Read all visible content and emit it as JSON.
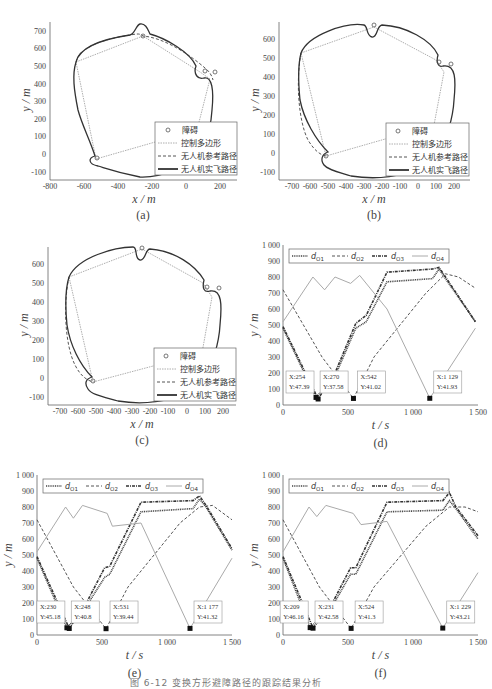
{
  "figure": {
    "caption": "图 6-12  变换方形避障路径的跟踪结果分析"
  },
  "legend_path": {
    "obstacle": "障碍",
    "polygon": "控制多边形",
    "reference": "无人机参考路径",
    "actual": "无人机实飞路径"
  },
  "legend_dist": {
    "d1": "d",
    "d1_sub": "O1",
    "d2": "d",
    "d2_sub": "O2",
    "d3": "d",
    "d3_sub": "O3",
    "d4": "d",
    "d4_sub": "O4"
  },
  "panels": {
    "a": {
      "label": "(a)",
      "xlabel": "x / m",
      "ylabel": "y / m"
    },
    "b": {
      "label": "(b)",
      "xlabel": "x / m",
      "ylabel": "y / m"
    },
    "c": {
      "label": "(c)",
      "xlabel": "x / m",
      "ylabel": "y / m"
    },
    "d": {
      "label": "(d)",
      "xlabel": "t / s",
      "ylabel": "y / m",
      "ann": [
        {
          "x": "X:254",
          "y": "Y:47.39"
        },
        {
          "x": "X:270",
          "y": "Y:37.58"
        },
        {
          "x": "X:542",
          "y": "Y:41.02"
        },
        {
          "x": "X:1 129",
          "y": "Y:41.93"
        }
      ]
    },
    "e": {
      "label": "(e)",
      "xlabel": "t / s",
      "ylabel": "y / m",
      "ann": [
        {
          "x": "X:230",
          "y": "Y:45.18"
        },
        {
          "x": "X:248",
          "y": "Y:40.8"
        },
        {
          "x": "X:531",
          "y": "Y:39.44"
        },
        {
          "x": "X:1 177",
          "y": "Y:41.32"
        }
      ]
    },
    "f": {
      "label": "(f)",
      "xlabel": "t / s",
      "ylabel": "y / m",
      "ann": [
        {
          "x": "X:209",
          "y": "Y:46.16"
        },
        {
          "x": "X:231",
          "y": "Y:42.58"
        },
        {
          "x": "X:524",
          "y": "Y:41.3"
        },
        {
          "x": "X:1 229",
          "y": "Y:43.21"
        }
      ]
    }
  },
  "chart_data": [
    {
      "id": "a",
      "type": "line",
      "title": "(a)",
      "xlabel": "x/m",
      "ylabel": "y/m",
      "xlim": [
        -800,
        300
      ],
      "ylim": [
        -150,
        750
      ],
      "xticks": [
        -800,
        -600,
        -400,
        -200,
        0,
        200
      ],
      "yticks": [
        -100,
        0,
        100,
        200,
        300,
        400,
        500,
        600,
        700
      ],
      "legend": [
        "障碍",
        "控制多边形",
        "无人机参考路径",
        "无人机实飞路径"
      ],
      "legend_position": "lower right",
      "obstacles": [
        [
          -255,
          670
        ],
        [
          105,
          470
        ],
        [
          170,
          465
        ],
        [
          -520,
          -20
        ]
      ],
      "control_polygon": [
        [
          -650,
          520
        ],
        [
          -255,
          670
        ],
        [
          90,
          470
        ],
        [
          140,
          430
        ],
        [
          60,
          150
        ],
        [
          -520,
          -20
        ],
        [
          -650,
          520
        ]
      ]
    },
    {
      "id": "b",
      "type": "line",
      "title": "(b)",
      "xlabel": "x/m",
      "ylabel": "y/m",
      "xlim": [
        -780,
        270
      ],
      "ylim": [
        -150,
        680
      ],
      "xticks": [
        -700,
        -600,
        -500,
        -400,
        -300,
        -200,
        -100,
        0,
        100,
        200
      ],
      "yticks": [
        -100,
        0,
        100,
        200,
        300,
        400,
        500,
        600
      ],
      "legend": [
        "障碍",
        "控制多边形",
        "无人机参考路径",
        "无人机实飞路径"
      ],
      "legend_position": "lower right",
      "obstacles": [
        [
          -255,
          670
        ],
        [
          105,
          470
        ],
        [
          170,
          465
        ],
        [
          -520,
          -20
        ]
      ]
    },
    {
      "id": "c",
      "type": "line",
      "title": "(c)",
      "xlabel": "x/m",
      "ylabel": "y/m",
      "xlim": [
        -780,
        270
      ],
      "ylim": [
        -150,
        680
      ],
      "xticks": [
        -700,
        -600,
        -500,
        -400,
        -300,
        -200,
        -100,
        0,
        100,
        200
      ],
      "yticks": [
        -100,
        0,
        100,
        200,
        300,
        400,
        500,
        600
      ],
      "legend": [
        "障碍",
        "控制多边形",
        "无人机参考路径",
        "无人机实飞路径"
      ],
      "legend_position": "lower right",
      "obstacles": [
        [
          -255,
          670
        ],
        [
          105,
          470
        ],
        [
          170,
          465
        ],
        [
          -520,
          -20
        ]
      ]
    },
    {
      "id": "d",
      "type": "line",
      "title": "(d)",
      "xlabel": "t/s",
      "ylabel": "y/m",
      "xlim": [
        0,
        1500
      ],
      "ylim": [
        0,
        1000
      ],
      "xticks": [
        0,
        500,
        1000,
        1500
      ],
      "yticks": [
        0,
        100,
        200,
        300,
        400,
        500,
        600,
        700,
        800,
        900,
        1000
      ],
      "legend": [
        "d_O1",
        "d_O2",
        "d_O3",
        "d_O4"
      ],
      "legend_position": "top",
      "series": [
        {
          "name": "d_O1",
          "x": [
            0,
            254,
            400,
            560,
            640,
            800,
            1150,
            1200,
            1250,
            1480
          ],
          "y": [
            480,
            47,
            180,
            480,
            520,
            770,
            790,
            850,
            790,
            520
          ]
        },
        {
          "name": "d_O2",
          "x": [
            0,
            300,
            542,
            700,
            1100,
            1250,
            1350,
            1480
          ],
          "y": [
            720,
            300,
            41,
            300,
            700,
            820,
            800,
            730
          ]
        },
        {
          "name": "d_O3",
          "x": [
            0,
            270,
            400,
            560,
            640,
            800,
            1150,
            1200,
            1250,
            1480
          ],
          "y": [
            490,
            38,
            200,
            510,
            560,
            830,
            850,
            860,
            800,
            520
          ]
        },
        {
          "name": "d_O4",
          "x": [
            0,
            230,
            320,
            400,
            520,
            590,
            800,
            1129,
            1480
          ],
          "y": [
            520,
            800,
            720,
            800,
            760,
            810,
            600,
            42,
            480
          ]
        }
      ],
      "annotations": [
        {
          "x": 254,
          "y": 47.39
        },
        {
          "x": 270,
          "y": 37.58
        },
        {
          "x": 542,
          "y": 41.02
        },
        {
          "x": 1129,
          "y": 41.93
        }
      ]
    },
    {
      "id": "e",
      "type": "line",
      "title": "(e)",
      "xlabel": "t/s",
      "ylabel": "y/m",
      "xlim": [
        0,
        1500
      ],
      "ylim": [
        0,
        1000
      ],
      "xticks": [
        0,
        500,
        1000,
        1500
      ],
      "yticks": [
        0,
        100,
        200,
        300,
        400,
        500,
        600,
        700,
        800,
        900,
        1000
      ],
      "legend": [
        "d_O1",
        "d_O2",
        "d_O3",
        "d_O4"
      ],
      "legend_position": "top",
      "series": [
        {
          "name": "d_O1",
          "x": [
            0,
            230,
            380,
            520,
            560,
            800,
            1200,
            1250,
            1300,
            1500
          ],
          "y": [
            480,
            45,
            180,
            360,
            380,
            770,
            790,
            850,
            800,
            530
          ]
        },
        {
          "name": "d_O2",
          "x": [
            0,
            280,
            531,
            700,
            1100,
            1250,
            1350,
            1500
          ],
          "y": [
            720,
            300,
            39,
            300,
            700,
            800,
            810,
            720
          ]
        },
        {
          "name": "d_O3",
          "x": [
            0,
            248,
            380,
            520,
            560,
            800,
            1200,
            1250,
            1300,
            1500
          ],
          "y": [
            490,
            41,
            200,
            420,
            430,
            830,
            840,
            870,
            810,
            540
          ]
        },
        {
          "name": "d_O4",
          "x": [
            0,
            220,
            280,
            350,
            540,
            580,
            800,
            1177,
            1500
          ],
          "y": [
            520,
            800,
            730,
            810,
            760,
            680,
            700,
            41,
            480
          ]
        }
      ],
      "annotations": [
        {
          "x": 230,
          "y": 45.18
        },
        {
          "x": 248,
          "y": 40.8
        },
        {
          "x": 531,
          "y": 39.44
        },
        {
          "x": 1177,
          "y": 41.32
        }
      ]
    },
    {
      "id": "f",
      "type": "line",
      "title": "(f)",
      "xlabel": "t/s",
      "ylabel": "y/m",
      "xlim": [
        0,
        1500
      ],
      "ylim": [
        0,
        1000
      ],
      "xticks": [
        0,
        500,
        1000,
        1500
      ],
      "yticks": [
        0,
        100,
        200,
        300,
        400,
        500,
        600,
        700,
        800,
        900,
        1000
      ],
      "legend": [
        "d_O1",
        "d_O2",
        "d_O3",
        "d_O4"
      ],
      "legend_position": "top",
      "series": [
        {
          "name": "d_O1",
          "x": [
            0,
            209,
            380,
            520,
            560,
            800,
            1230,
            1280,
            1330,
            1500
          ],
          "y": [
            480,
            46,
            180,
            380,
            380,
            770,
            780,
            840,
            790,
            600
          ]
        },
        {
          "name": "d_O2",
          "x": [
            0,
            280,
            524,
            700,
            1100,
            1280,
            1400,
            1500
          ],
          "y": [
            720,
            300,
            41,
            300,
            680,
            800,
            800,
            770
          ]
        },
        {
          "name": "d_O3",
          "x": [
            0,
            231,
            380,
            520,
            560,
            800,
            1230,
            1280,
            1330,
            1500
          ],
          "y": [
            490,
            43,
            200,
            420,
            420,
            830,
            840,
            890,
            800,
            620
          ]
        },
        {
          "name": "d_O4",
          "x": [
            0,
            200,
            260,
            330,
            540,
            600,
            800,
            1229,
            1500
          ],
          "y": [
            520,
            800,
            740,
            810,
            760,
            690,
            710,
            43,
            390
          ]
        }
      ],
      "annotations": [
        {
          "x": 209,
          "y": 46.16
        },
        {
          "x": 231,
          "y": 42.58
        },
        {
          "x": 524,
          "y": 41.3
        },
        {
          "x": 1229,
          "y": 43.21
        }
      ]
    }
  ]
}
